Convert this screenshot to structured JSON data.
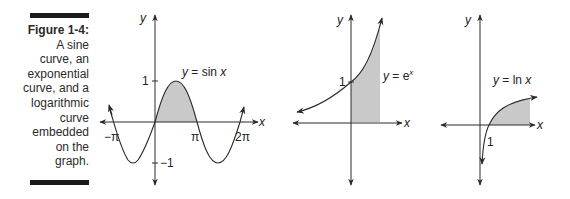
{
  "caption": {
    "title": "Figure 1-4:",
    "lines": [
      "A sine",
      "curve, an",
      "exponential",
      "curve, and a",
      "logarithmic",
      "curve",
      "embedded",
      "on the",
      "graph."
    ]
  },
  "colors": {
    "line": "#2a2a2a",
    "shade": "#c9c9c9",
    "bar": "#1a1a1a"
  },
  "graphs": {
    "sine": {
      "equation_y": "y",
      "equation_rest": " = sin ",
      "equation_x": "x",
      "axis_x": "x",
      "axis_y": "y",
      "tick_y_pos": "1",
      "tick_y_neg": "−1",
      "tick_neg_pi": "−π",
      "tick_pi": "π",
      "tick_2pi": "2π"
    },
    "exponential": {
      "equation_y": "y",
      "equation_rest": " = e",
      "equation_sup": "x",
      "axis_x": "x",
      "axis_y": "y",
      "tick_y": "1"
    },
    "logarithmic": {
      "equation_y": "y",
      "equation_rest": " = ln ",
      "equation_x": "x",
      "axis_x": "x",
      "axis_y": "y",
      "tick_x": "1"
    }
  }
}
